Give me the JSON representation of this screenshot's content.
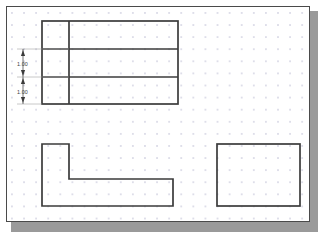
{
  "app": {
    "type": "cad-drawing-canvas",
    "background_color": "#ffffff",
    "canvas_border_color": "#4a4a4a",
    "shadow_color": "#9a9a9a",
    "grid": {
      "visible": true,
      "style": "dots",
      "dot_color": "#dcdce8",
      "spacing_px": 12
    }
  },
  "drawing": {
    "line_color": "#3b3b3b",
    "shapes": [
      {
        "name": "divided-rectangle",
        "type": "rectangle-with-dividers",
        "x": 35,
        "y": 14,
        "width": 136,
        "height": 83,
        "horizontal_dividers_y": [
          42,
          70
        ],
        "vertical_dividers_x": [
          62
        ]
      },
      {
        "name": "l-shape",
        "type": "polygon",
        "points": "35,137 62,137 62,172 166,172 166,199 35,199"
      },
      {
        "name": "square",
        "type": "rectangle",
        "x": 210,
        "y": 137,
        "width": 83,
        "height": 62
      }
    ],
    "dimensions": [
      {
        "name": "dimension-upper",
        "value": "1.00",
        "orientation": "vertical",
        "x": 16,
        "y_start": 42,
        "y_end": 70,
        "extension_to_x": 62
      },
      {
        "name": "dimension-lower",
        "value": "1.00",
        "orientation": "vertical",
        "x": 16,
        "y_start": 70,
        "y_end": 97,
        "extension_to_x": 62
      }
    ]
  }
}
